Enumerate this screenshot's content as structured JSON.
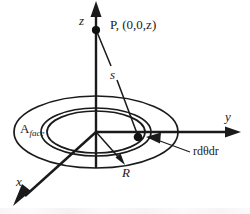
{
  "figure": {
    "background_color": "#ffffff",
    "ink_color": "#1a1a1a"
  },
  "axes": {
    "z": {
      "label": "z",
      "direction": "up"
    },
    "y": {
      "label": "y",
      "direction": "right"
    },
    "x": {
      "label": "x",
      "direction": "down-left"
    }
  },
  "labels": {
    "field_point": "P, (0,0,z)",
    "distance": "s",
    "radius": "R",
    "area_element": "rdθdr",
    "face_area_main": "A",
    "face_area_sub": "face"
  }
}
